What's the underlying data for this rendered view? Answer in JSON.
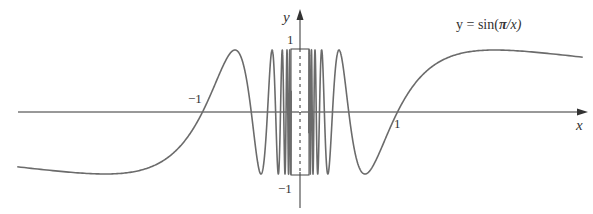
{
  "chart_data": {
    "type": "line",
    "title": "y = sin(π/x)",
    "function": "sin(pi/x)",
    "xlabel": "x",
    "ylabel": "y",
    "x_ticks": [
      {
        "value": -1,
        "label": "−1"
      },
      {
        "value": 1,
        "label": "1"
      }
    ],
    "y_ticks": [
      {
        "value": 1,
        "label": "1"
      },
      {
        "value": -1,
        "label": "−1"
      }
    ],
    "xlim": [
      -2.9,
      2.9
    ],
    "ylim": [
      -1,
      1
    ],
    "grid": false,
    "legend": null,
    "annotations": [
      {
        "text": "y = sin(π/x)",
        "position": "upper right, above curve"
      },
      {
        "type": "dashed-rectangle",
        "note": "region near x=0 where the curve oscillates infinitely between −1 and 1"
      }
    ],
    "sample_points": [
      {
        "x": -2.9,
        "y": -0.89
      },
      {
        "x": -2.0,
        "y": -1.0
      },
      {
        "x": -1.0,
        "y": 0.0
      },
      {
        "x": -0.667,
        "y": 1.0
      },
      {
        "x": -0.5,
        "y": 0.0
      },
      {
        "x": -0.4,
        "y": -1.0
      },
      {
        "x": 0.4,
        "y": 1.0
      },
      {
        "x": 0.5,
        "y": 0.0
      },
      {
        "x": 0.667,
        "y": -1.0
      },
      {
        "x": 1.0,
        "y": 0.0
      },
      {
        "x": 2.0,
        "y": 1.0
      },
      {
        "x": 2.9,
        "y": 0.89
      }
    ]
  },
  "labels": {
    "equation_prefix": "y = sin(",
    "equation_pi": "π",
    "equation_suffix": "/x)",
    "x_axis": "x",
    "y_axis": "y",
    "x_tick_neg": "−1",
    "x_tick_pos": "1",
    "y_tick_pos": "1",
    "y_tick_neg": "−1"
  },
  "style": {
    "curve_color": "#6b6b6b",
    "axis_color": "#333333"
  }
}
